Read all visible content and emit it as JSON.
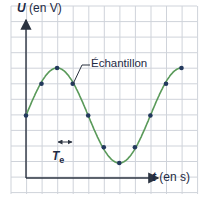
{
  "chart_data": {
    "type": "line",
    "title": "",
    "xlabel_var": "t",
    "xlabel_unit": "(en s)",
    "ylabel_var": "U",
    "ylabel_unit": "(en V)",
    "annotation": "Échantillon",
    "sample_period_label": "T",
    "sample_period_sub": "e",
    "grid": true,
    "axis_ticks": "none (unlabeled grid)",
    "x": [
      0,
      1,
      2,
      3,
      4,
      5,
      6,
      7,
      8,
      9,
      10
    ],
    "x_unit_note": "in sampling periods Te",
    "samples": [
      0,
      2,
      3,
      2,
      0,
      -2,
      -3,
      -2,
      0,
      2,
      3
    ],
    "y_unit_note": "in grid squares relative to midline",
    "signal": "sinusoid, 8 samples per period",
    "colors": {
      "curve": "#5a9a5a",
      "points": "#23395d",
      "grid": "#c8ccd4",
      "axes": "#2b3340",
      "text": "#1e2a44"
    }
  }
}
